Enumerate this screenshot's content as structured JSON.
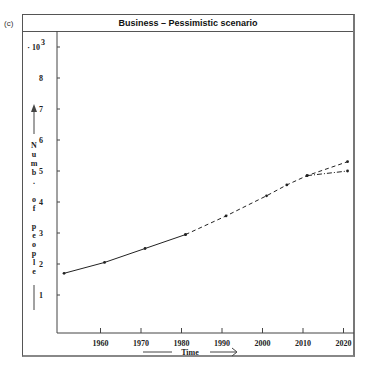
{
  "panel_label": "(c)",
  "title": "Business – Pessimistic scenario",
  "y_multiplier": "· 10",
  "y_multiplier_exp": "3",
  "xlabel": "Time",
  "ylabel": "Numb. of people",
  "chart_data": {
    "type": "line",
    "title": "Business – Pessimistic scenario",
    "xlabel": "Time",
    "ylabel": "Numb. of people (· 10^3)",
    "x_ticks": [
      1960,
      1970,
      1980,
      1990,
      2000,
      2010,
      2020
    ],
    "y_ticks": [
      1,
      2,
      3,
      4,
      5,
      6,
      7,
      8,
      9
    ],
    "xlim": [
      1948,
      2022
    ],
    "ylim": [
      0,
      9.5
    ],
    "grid": false,
    "legend": null,
    "series": [
      {
        "name": "Historical",
        "style": "solid",
        "x": [
          1951,
          1961,
          1971,
          1981
        ],
        "y": [
          1.7,
          2.05,
          2.5,
          2.95
        ]
      },
      {
        "name": "Projection (trend)",
        "style": "dashed",
        "x": [
          1981,
          1991,
          2001,
          2006,
          2011,
          2021
        ],
        "y": [
          2.95,
          3.55,
          4.2,
          4.55,
          4.85,
          5.3
        ]
      },
      {
        "name": "Projection (pessimistic)",
        "style": "dash-dot",
        "x": [
          2011,
          2021
        ],
        "y": [
          4.85,
          5.0
        ]
      }
    ]
  }
}
